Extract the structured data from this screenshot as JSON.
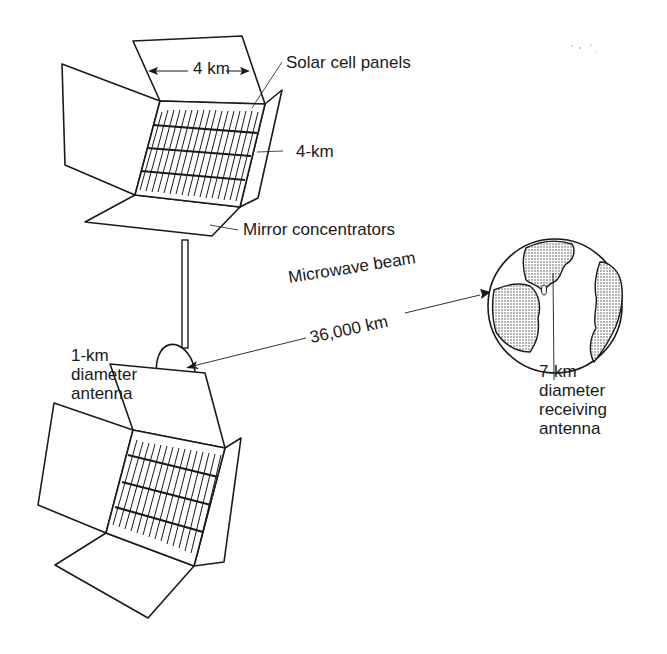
{
  "diagram": {
    "labels": {
      "width": "4 km",
      "solar_panels": "Solar cell panels",
      "height": "4-km",
      "mirrors": "Mirror concentrators",
      "beam": "Microwave beam",
      "distance": "36,000 km",
      "antenna_line1": "1-km",
      "antenna_line2": "diameter",
      "antenna_line3": "antenna",
      "receiver_line1": "7-km",
      "receiver_line2": "diameter",
      "receiver_line3": "receiving",
      "receiver_line4": "antenna"
    },
    "components": [
      "upper solar array",
      "lower solar array",
      "transmitting antenna",
      "Earth with receiving antenna"
    ],
    "colors": {
      "ink": "#1a1a1a",
      "background": "#ffffff",
      "land_fill": "#bdbdbd"
    }
  }
}
